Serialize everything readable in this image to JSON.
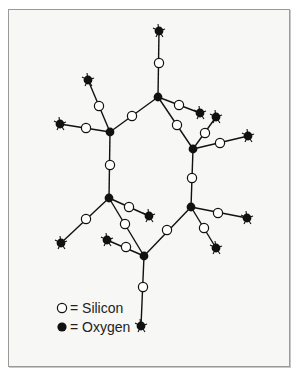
{
  "figure": {
    "type": "silicate ring diagram",
    "legend": [
      {
        "symbol": "open-circle",
        "label": "= Silicon"
      },
      {
        "symbol": "filled-circle",
        "label": "= Oxygen"
      }
    ]
  },
  "colors": {
    "line": "#111111",
    "oxygen": "#111111",
    "silicon_fill": "#ffffff",
    "background": "#f7f7f6",
    "border": "#9a9a9a"
  },
  "oxygen_nodes": [
    [
      158,
      97
    ],
    [
      110,
      132
    ],
    [
      193,
      149
    ],
    [
      109,
      198
    ],
    [
      191,
      207
    ],
    [
      144,
      256
    ],
    [
      159,
      31
    ],
    [
      88,
      80
    ],
    [
      60,
      124
    ],
    [
      200,
      113
    ],
    [
      216,
      117
    ],
    [
      248,
      136
    ],
    [
      61,
      243
    ],
    [
      149,
      216
    ],
    [
      107,
      240
    ],
    [
      247,
      218
    ],
    [
      216,
      248
    ],
    [
      141,
      326
    ]
  ],
  "silicon_nodes": [
    [
      159,
      63
    ],
    [
      99,
      106
    ],
    [
      86,
      128
    ],
    [
      132,
      116
    ],
    [
      179,
      105
    ],
    [
      177,
      125
    ],
    [
      205,
      133
    ],
    [
      220,
      143
    ],
    [
      110,
      165
    ],
    [
      192,
      178
    ],
    [
      86,
      219
    ],
    [
      129,
      207
    ],
    [
      125,
      224
    ],
    [
      126,
      247
    ],
    [
      167,
      230
    ],
    [
      218,
      213
    ],
    [
      204,
      228
    ],
    [
      143,
      287
    ]
  ],
  "bonds": [
    [
      [
        158,
        97
      ],
      [
        159,
        31
      ]
    ],
    [
      [
        158,
        97
      ],
      [
        110,
        132
      ]
    ],
    [
      [
        158,
        97
      ],
      [
        200,
        113
      ]
    ],
    [
      [
        158,
        97
      ],
      [
        193,
        149
      ]
    ],
    [
      [
        110,
        132
      ],
      [
        88,
        80
      ]
    ],
    [
      [
        110,
        132
      ],
      [
        60,
        124
      ]
    ],
    [
      [
        110,
        132
      ],
      [
        109,
        198
      ]
    ],
    [
      [
        193,
        149
      ],
      [
        216,
        117
      ]
    ],
    [
      [
        193,
        149
      ],
      [
        248,
        136
      ]
    ],
    [
      [
        193,
        149
      ],
      [
        191,
        207
      ]
    ],
    [
      [
        109,
        198
      ],
      [
        61,
        243
      ]
    ],
    [
      [
        109,
        198
      ],
      [
        149,
        216
      ]
    ],
    [
      [
        109,
        198
      ],
      [
        144,
        256
      ]
    ],
    [
      [
        191,
        207
      ],
      [
        144,
        256
      ]
    ],
    [
      [
        191,
        207
      ],
      [
        247,
        218
      ]
    ],
    [
      [
        191,
        207
      ],
      [
        216,
        248
      ]
    ],
    [
      [
        144,
        256
      ],
      [
        107,
        240
      ]
    ],
    [
      [
        144,
        256
      ],
      [
        141,
        326
      ]
    ]
  ],
  "terminal_oxygens": [
    [
      159,
      31
    ],
    [
      88,
      80
    ],
    [
      60,
      124
    ],
    [
      200,
      113
    ],
    [
      216,
      117
    ],
    [
      248,
      136
    ],
    [
      61,
      243
    ],
    [
      149,
      216
    ],
    [
      107,
      240
    ],
    [
      247,
      218
    ],
    [
      216,
      248
    ],
    [
      141,
      326
    ]
  ]
}
